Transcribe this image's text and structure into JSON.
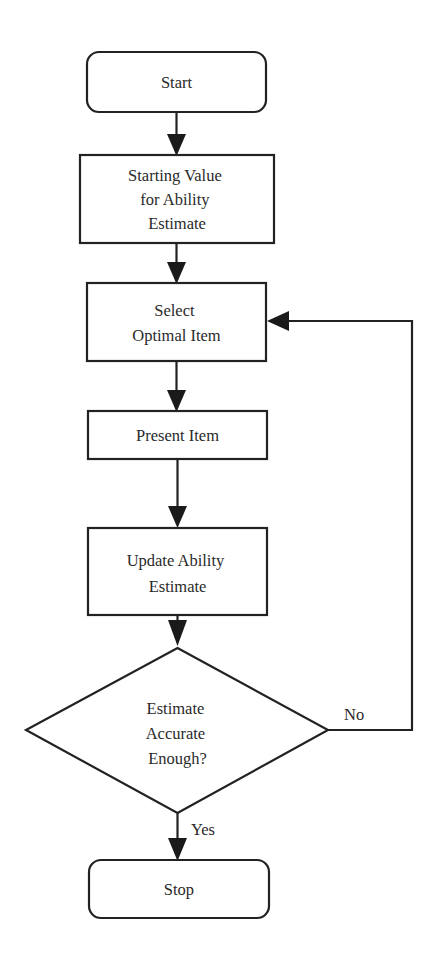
{
  "diagram": {
    "type": "flowchart",
    "nodes": [
      {
        "id": "start",
        "shape": "terminator",
        "lines": [
          "Start"
        ]
      },
      {
        "id": "starting_value",
        "shape": "process",
        "lines": [
          "Starting Value",
          "for Ability",
          "Estimate"
        ]
      },
      {
        "id": "select_item",
        "shape": "process",
        "lines": [
          "Select",
          "Optimal Item"
        ]
      },
      {
        "id": "present_item",
        "shape": "process",
        "lines": [
          "Present Item"
        ]
      },
      {
        "id": "update_estimate",
        "shape": "process",
        "lines": [
          "Update Ability",
          "Estimate"
        ]
      },
      {
        "id": "decision",
        "shape": "decision",
        "lines": [
          "Estimate",
          "Accurate",
          "Enough?"
        ]
      },
      {
        "id": "stop",
        "shape": "terminator",
        "lines": [
          "Stop"
        ]
      }
    ],
    "edges": [
      {
        "from": "start",
        "to": "starting_value",
        "label": ""
      },
      {
        "from": "starting_value",
        "to": "select_item",
        "label": ""
      },
      {
        "from": "select_item",
        "to": "present_item",
        "label": ""
      },
      {
        "from": "present_item",
        "to": "update_estimate",
        "label": ""
      },
      {
        "from": "update_estimate",
        "to": "decision",
        "label": ""
      },
      {
        "from": "decision",
        "to": "select_item",
        "label": "No"
      },
      {
        "from": "decision",
        "to": "stop",
        "label": "Yes"
      }
    ]
  },
  "colors": {
    "stroke": "#222222",
    "background": "#ffffff",
    "text": "#2a2a2a"
  }
}
